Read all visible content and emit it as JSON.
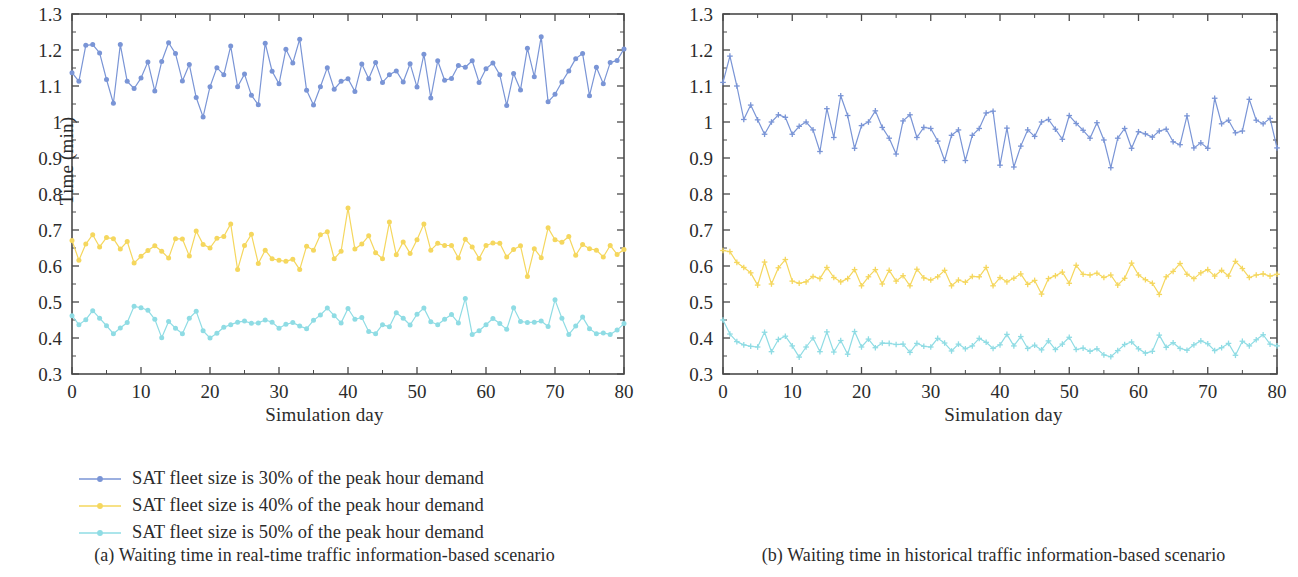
{
  "figure": {
    "panels": [
      {
        "id": "a",
        "caption": "(a)  Waiting time in real-time traffic information-based scenario",
        "marker": "circle",
        "ylabel": "Time (min)",
        "xlabel": "Simulation day"
      },
      {
        "id": "b",
        "caption": "(b)  Waiting time in historical traffic information-based scenario",
        "marker": "plus",
        "ylabel": "Time (min)",
        "xlabel": "Simulation day"
      }
    ],
    "legend_labels": [
      "SAT fleet size is 30% of the peak hour demand",
      "SAT fleet size is 40% of the peak hour demand",
      "SAT fleet size is 50% of the peak hour demand"
    ],
    "colors": {
      "series_30": "#7a95d6",
      "series_40": "#f5d75e",
      "series_50": "#8fdce4",
      "axis": "#4a4a4a",
      "text": "#2b2b2b"
    }
  },
  "chart_data": [
    {
      "type": "line",
      "title": "(a)  Waiting time in real-time traffic information-based scenario",
      "xlabel": "Simulation day",
      "ylabel": "Time (min)",
      "xlim": [
        0,
        80
      ],
      "ylim": [
        0.3,
        1.3
      ],
      "xticks": [
        0,
        10,
        20,
        30,
        40,
        50,
        60,
        70,
        80
      ],
      "yticks": [
        0.3,
        0.4,
        0.5,
        0.6,
        0.7,
        0.8,
        0.9,
        1.0,
        1.1,
        1.2,
        1.3
      ],
      "ytick_labels": [
        "0.3",
        "0.4",
        "0.5",
        "0.6",
        "0.7",
        "0.8",
        "0.9",
        "1",
        "1.1",
        "1.2",
        "1.3"
      ],
      "grid": false,
      "legend_position": "below",
      "marker": "circle",
      "series": [
        {
          "name": "SAT fleet size is 30% of the peak hour demand",
          "color": "#7a95d6",
          "values": [
            1.137,
            1.113,
            1.213,
            1.215,
            1.192,
            1.118,
            1.052,
            1.215,
            1.113,
            1.093,
            1.122,
            1.167,
            1.086,
            1.168,
            1.22,
            1.19,
            1.114,
            1.16,
            1.068,
            1.014,
            1.098,
            1.151,
            1.131,
            1.211,
            1.098,
            1.133,
            1.074,
            1.048,
            1.219,
            1.141,
            1.106,
            1.202,
            1.164,
            1.23,
            1.088,
            1.047,
            1.098,
            1.151,
            1.091,
            1.113,
            1.12,
            1.085,
            1.161,
            1.12,
            1.165,
            1.11,
            1.131,
            1.142,
            1.111,
            1.162,
            1.097,
            1.188,
            1.067,
            1.17,
            1.116,
            1.121,
            1.157,
            1.152,
            1.17,
            1.11,
            1.148,
            1.164,
            1.131,
            1.046,
            1.135,
            1.089,
            1.205,
            1.126,
            1.237,
            1.056,
            1.077,
            1.111,
            1.142,
            1.176,
            1.19,
            1.073,
            1.152,
            1.106,
            1.165,
            1.171,
            1.203
          ]
        },
        {
          "name": "SAT fleet size is 40% of the peak hour demand",
          "color": "#f5d75e",
          "values": [
            0.671,
            0.616,
            0.661,
            0.687,
            0.653,
            0.679,
            0.676,
            0.647,
            0.668,
            0.608,
            0.627,
            0.643,
            0.656,
            0.641,
            0.622,
            0.676,
            0.675,
            0.628,
            0.697,
            0.66,
            0.65,
            0.677,
            0.682,
            0.717,
            0.59,
            0.657,
            0.688,
            0.607,
            0.644,
            0.62,
            0.616,
            0.613,
            0.619,
            0.59,
            0.655,
            0.644,
            0.687,
            0.695,
            0.62,
            0.641,
            0.761,
            0.647,
            0.661,
            0.684,
            0.637,
            0.62,
            0.722,
            0.631,
            0.667,
            0.635,
            0.673,
            0.717,
            0.644,
            0.663,
            0.657,
            0.657,
            0.622,
            0.674,
            0.653,
            0.621,
            0.657,
            0.664,
            0.663,
            0.625,
            0.646,
            0.656,
            0.571,
            0.648,
            0.623,
            0.706,
            0.673,
            0.666,
            0.682,
            0.63,
            0.66,
            0.648,
            0.644,
            0.625,
            0.657,
            0.632,
            0.646
          ]
        },
        {
          "name": "SAT fleet size is 50% of the peak hour demand",
          "color": "#8fdce4",
          "values": [
            0.462,
            0.437,
            0.451,
            0.476,
            0.455,
            0.434,
            0.412,
            0.428,
            0.443,
            0.488,
            0.484,
            0.477,
            0.452,
            0.401,
            0.446,
            0.427,
            0.412,
            0.455,
            0.474,
            0.42,
            0.4,
            0.413,
            0.43,
            0.437,
            0.444,
            0.447,
            0.441,
            0.442,
            0.45,
            0.444,
            0.427,
            0.438,
            0.443,
            0.433,
            0.426,
            0.449,
            0.464,
            0.483,
            0.462,
            0.442,
            0.482,
            0.452,
            0.457,
            0.418,
            0.412,
            0.437,
            0.431,
            0.47,
            0.455,
            0.436,
            0.466,
            0.483,
            0.445,
            0.437,
            0.452,
            0.465,
            0.442,
            0.51,
            0.41,
            0.42,
            0.437,
            0.454,
            0.44,
            0.424,
            0.484,
            0.446,
            0.443,
            0.444,
            0.447,
            0.432,
            0.506,
            0.455,
            0.41,
            0.433,
            0.458,
            0.426,
            0.412,
            0.414,
            0.41,
            0.422,
            0.44
          ]
        }
      ]
    },
    {
      "type": "line",
      "title": "(b)  Waiting time in historical traffic information-based scenario",
      "xlabel": "Simulation day",
      "ylabel": "Time (min)",
      "xlim": [
        0,
        80
      ],
      "ylim": [
        0.3,
        1.3
      ],
      "xticks": [
        0,
        10,
        20,
        30,
        40,
        50,
        60,
        70,
        80
      ],
      "yticks": [
        0.3,
        0.4,
        0.5,
        0.6,
        0.7,
        0.8,
        0.9,
        1.0,
        1.1,
        1.2,
        1.3
      ],
      "ytick_labels": [
        "0.3",
        "0.4",
        "0.5",
        "0.6",
        "0.7",
        "0.8",
        "0.9",
        "1",
        "1.1",
        "1.2",
        "1.3"
      ],
      "grid": false,
      "legend_position": "below",
      "marker": "plus",
      "series": [
        {
          "name": "SAT fleet size is 30% of the peak hour demand",
          "color": "#7a95d6",
          "values": [
            1.11,
            1.183,
            1.1,
            1.007,
            1.047,
            1.006,
            0.966,
            1.0,
            1.02,
            1.013,
            0.966,
            0.988,
            1.0,
            0.978,
            0.918,
            1.037,
            0.957,
            1.073,
            1.018,
            0.927,
            0.99,
            1.0,
            1.031,
            0.985,
            0.955,
            0.911,
            1.003,
            1.02,
            0.957,
            0.985,
            0.982,
            0.947,
            0.893,
            0.963,
            0.978,
            0.893,
            0.963,
            0.982,
            1.025,
            1.03,
            0.88,
            0.983,
            0.875,
            0.933,
            0.978,
            0.96,
            1.0,
            1.007,
            0.98,
            0.952,
            1.018,
            0.996,
            0.977,
            0.955,
            0.998,
            0.95,
            0.873,
            0.955,
            0.982,
            0.927,
            0.973,
            0.967,
            0.958,
            0.975,
            0.98,
            0.945,
            0.937,
            1.017,
            0.928,
            0.942,
            0.927,
            1.066,
            0.995,
            1.005,
            0.97,
            0.975,
            1.063,
            1.005,
            0.995,
            1.01,
            0.928
          ]
        },
        {
          "name": "SAT fleet size is 40% of the peak hour demand",
          "color": "#f5d75e",
          "values": [
            0.643,
            0.64,
            0.61,
            0.596,
            0.581,
            0.547,
            0.611,
            0.55,
            0.595,
            0.618,
            0.558,
            0.552,
            0.556,
            0.571,
            0.565,
            0.596,
            0.568,
            0.556,
            0.565,
            0.59,
            0.545,
            0.57,
            0.59,
            0.55,
            0.588,
            0.558,
            0.573,
            0.545,
            0.591,
            0.567,
            0.561,
            0.57,
            0.588,
            0.545,
            0.561,
            0.555,
            0.571,
            0.57,
            0.596,
            0.545,
            0.568,
            0.556,
            0.566,
            0.578,
            0.549,
            0.56,
            0.522,
            0.565,
            0.573,
            0.583,
            0.552,
            0.602,
            0.577,
            0.575,
            0.58,
            0.568,
            0.575,
            0.547,
            0.566,
            0.608,
            0.575,
            0.562,
            0.552,
            0.521,
            0.57,
            0.585,
            0.607,
            0.577,
            0.565,
            0.581,
            0.59,
            0.572,
            0.588,
            0.572,
            0.613,
            0.593,
            0.568,
            0.575,
            0.578,
            0.572,
            0.577
          ]
        },
        {
          "name": "SAT fleet size is 50% of the peak hour demand",
          "color": "#8fdce4",
          "values": [
            0.45,
            0.411,
            0.39,
            0.381,
            0.377,
            0.375,
            0.416,
            0.362,
            0.396,
            0.405,
            0.378,
            0.347,
            0.375,
            0.4,
            0.362,
            0.417,
            0.361,
            0.393,
            0.355,
            0.418,
            0.375,
            0.397,
            0.373,
            0.386,
            0.385,
            0.382,
            0.383,
            0.36,
            0.385,
            0.377,
            0.375,
            0.399,
            0.386,
            0.364,
            0.383,
            0.37,
            0.378,
            0.399,
            0.388,
            0.371,
            0.381,
            0.41,
            0.378,
            0.404,
            0.371,
            0.38,
            0.367,
            0.392,
            0.368,
            0.383,
            0.402,
            0.368,
            0.372,
            0.363,
            0.37,
            0.353,
            0.348,
            0.365,
            0.382,
            0.389,
            0.37,
            0.358,
            0.363,
            0.408,
            0.374,
            0.387,
            0.371,
            0.366,
            0.381,
            0.392,
            0.384,
            0.365,
            0.373,
            0.385,
            0.352,
            0.391,
            0.378,
            0.395,
            0.409,
            0.383,
            0.378
          ]
        }
      ]
    }
  ]
}
